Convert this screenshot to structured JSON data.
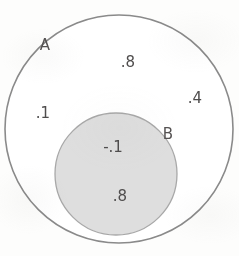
{
  "figure": {
    "type": "euler-diagram",
    "width": 239,
    "height": 256,
    "background_color": "#fdfdfc"
  },
  "sets": [
    {
      "id": "A",
      "label": "A",
      "label_x": 45,
      "label_y": 45,
      "center_x": 119,
      "center_y": 129,
      "radius": 114,
      "fill_color": "#ffffff",
      "stroke_color": "#8a8a8a"
    },
    {
      "id": "B",
      "label": "B",
      "label_x": 168,
      "label_y": 134,
      "center_x": 116,
      "center_y": 174,
      "radius": 61,
      "fill_color": "#dedede",
      "stroke_color": "#a8a8a8"
    }
  ],
  "values": [
    {
      "id": "a-top",
      "text": ".8",
      "x": 128,
      "y": 62,
      "region": "A-only"
    },
    {
      "id": "a-right",
      "text": ".4",
      "x": 195,
      "y": 98,
      "region": "A-only"
    },
    {
      "id": "a-left",
      "text": ".1",
      "x": 43,
      "y": 113,
      "region": "A-only"
    },
    {
      "id": "b-upper",
      "text": "-.1",
      "x": 113,
      "y": 147,
      "region": "B"
    },
    {
      "id": "b-lower",
      "text": ".8",
      "x": 120,
      "y": 196,
      "region": "B"
    }
  ],
  "chart_data": {
    "type": "diagram",
    "title": "",
    "diagram_kind": "euler-venn",
    "relationship": "B is a proper subset of A",
    "regions": [
      {
        "name": "A",
        "contains": [
          ".8",
          ".4",
          ".1"
        ]
      },
      {
        "name": "B",
        "contains": [
          "-.1",
          ".8"
        ]
      }
    ],
    "labels": [
      "A",
      "B",
      ".8",
      ".4",
      ".1",
      "-.1",
      ".8"
    ]
  }
}
